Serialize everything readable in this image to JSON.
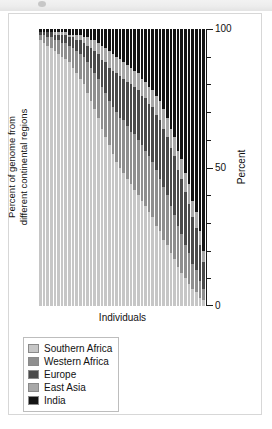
{
  "banner": {
    "label": ""
  },
  "figure": {
    "x_axis_title": "Individuals",
    "y_axis_title_line1": "Percent of genome from",
    "y_axis_title_line2": "different continental regions",
    "right_axis_title": "Percent",
    "axis_ticks": [
      {
        "value": 0,
        "label": "0",
        "major": true
      },
      {
        "value": 10,
        "label": "",
        "major": false
      },
      {
        "value": 20,
        "label": "",
        "major": false
      },
      {
        "value": 30,
        "label": "",
        "major": false
      },
      {
        "value": 40,
        "label": "",
        "major": false
      },
      {
        "value": 50,
        "label": "50",
        "major": true
      },
      {
        "value": 60,
        "label": "",
        "major": false
      },
      {
        "value": 70,
        "label": "",
        "major": false
      },
      {
        "value": 80,
        "label": "",
        "major": false
      },
      {
        "value": 90,
        "label": "",
        "major": false
      },
      {
        "value": 100,
        "label": "100",
        "major": true
      }
    ]
  },
  "legend": {
    "items": [
      {
        "label": "Southern Africa",
        "color": "#c6c6c6"
      },
      {
        "label": "Western Africa",
        "color": "#8f8f8f"
      },
      {
        "label": "Europe",
        "color": "#4a4a4a"
      },
      {
        "label": "East Asia",
        "color": "#a8a8a8"
      },
      {
        "label": "India",
        "color": "#141414"
      }
    ]
  },
  "chart_data": {
    "type": "bar",
    "stacked": true,
    "title": "",
    "xlabel": "Individuals",
    "ylabel": "Percent of genome from different continental regions",
    "right_ylabel": "Percent",
    "ylim": [
      0,
      100
    ],
    "yticks": [
      0,
      10,
      20,
      30,
      40,
      50,
      60,
      70,
      80,
      90,
      100
    ],
    "ytick_labels": [
      "0",
      "",
      "",
      "",
      "",
      "50",
      "",
      "",
      "",
      "",
      "100"
    ],
    "grid": false,
    "legend_position": "below-left",
    "series_order": [
      "Southern Africa",
      "Western Africa",
      "Europe",
      "East Asia",
      "India"
    ],
    "series_colors": {
      "Southern Africa": "#c6c6c6",
      "Western Africa": "#8f8f8f",
      "Europe": "#4a4a4a",
      "East Asia": "#a8a8a8",
      "India": "#141414"
    },
    "note": "Each bar is one individual; segments sum to 100 percent. Bars sorted by increasing non-Southern-African ancestry.",
    "categories": [
      "1",
      "2",
      "3",
      "4",
      "5",
      "6",
      "7",
      "8",
      "9",
      "10",
      "11",
      "12",
      "13",
      "14",
      "15",
      "16",
      "17",
      "18",
      "19",
      "20",
      "21",
      "22",
      "23",
      "24",
      "25",
      "26",
      "27",
      "28",
      "29",
      "30",
      "31",
      "32",
      "33",
      "34",
      "35",
      "36",
      "37",
      "38",
      "39",
      "40",
      "41",
      "42",
      "43",
      "44",
      "45",
      "46"
    ],
    "bars": [
      {
        "individual": "1",
        "Southern Africa": 96,
        "Western Africa": 2,
        "Europe": 1,
        "East Asia": 0,
        "India": 1
      },
      {
        "individual": "2",
        "Southern Africa": 95,
        "Western Africa": 3,
        "Europe": 1,
        "East Asia": 0,
        "India": 1
      },
      {
        "individual": "3",
        "Southern Africa": 94,
        "Western Africa": 3,
        "Europe": 2,
        "East Asia": 0,
        "India": 1
      },
      {
        "individual": "4",
        "Southern Africa": 93,
        "Western Africa": 4,
        "Europe": 2,
        "East Asia": 0,
        "India": 1
      },
      {
        "individual": "5",
        "Southern Africa": 92,
        "Western Africa": 4,
        "Europe": 2,
        "East Asia": 1,
        "India": 1
      },
      {
        "individual": "6",
        "Southern Africa": 91,
        "Western Africa": 5,
        "Europe": 2,
        "East Asia": 1,
        "India": 1
      },
      {
        "individual": "7",
        "Southern Africa": 90,
        "Western Africa": 5,
        "Europe": 3,
        "East Asia": 1,
        "India": 1
      },
      {
        "individual": "8",
        "Southern Africa": 89,
        "Western Africa": 6,
        "Europe": 3,
        "East Asia": 1,
        "India": 1
      },
      {
        "individual": "9",
        "Southern Africa": 88,
        "Western Africa": 6,
        "Europe": 3,
        "East Asia": 1,
        "India": 2
      },
      {
        "individual": "10",
        "Southern Africa": 86,
        "Western Africa": 7,
        "Europe": 4,
        "East Asia": 1,
        "India": 2
      },
      {
        "individual": "11",
        "Southern Africa": 84,
        "Western Africa": 8,
        "Europe": 4,
        "East Asia": 2,
        "India": 2
      },
      {
        "individual": "12",
        "Southern Africa": 82,
        "Western Africa": 9,
        "Europe": 5,
        "East Asia": 2,
        "India": 2
      },
      {
        "individual": "13",
        "Southern Africa": 80,
        "Western Africa": 10,
        "Europe": 5,
        "East Asia": 2,
        "India": 3
      },
      {
        "individual": "14",
        "Southern Africa": 77,
        "Western Africa": 11,
        "Europe": 6,
        "East Asia": 3,
        "India": 3
      },
      {
        "individual": "15",
        "Southern Africa": 74,
        "Western Africa": 12,
        "Europe": 7,
        "East Asia": 3,
        "India": 4
      },
      {
        "individual": "16",
        "Southern Africa": 71,
        "Western Africa": 13,
        "Europe": 8,
        "East Asia": 4,
        "India": 4
      },
      {
        "individual": "17",
        "Southern Africa": 68,
        "Western Africa": 14,
        "Europe": 9,
        "East Asia": 4,
        "India": 5
      },
      {
        "individual": "18",
        "Southern Africa": 64,
        "Western Africa": 15,
        "Europe": 10,
        "East Asia": 5,
        "India": 6
      },
      {
        "individual": "19",
        "Southern Africa": 61,
        "Western Africa": 16,
        "Europe": 11,
        "East Asia": 5,
        "India": 7
      },
      {
        "individual": "20",
        "Southern Africa": 58,
        "Western Africa": 16,
        "Europe": 12,
        "East Asia": 6,
        "India": 8
      },
      {
        "individual": "21",
        "Southern Africa": 55,
        "Western Africa": 17,
        "Europe": 13,
        "East Asia": 6,
        "India": 9
      },
      {
        "individual": "22",
        "Southern Africa": 52,
        "Western Africa": 18,
        "Europe": 14,
        "East Asia": 6,
        "India": 10
      },
      {
        "individual": "23",
        "Southern Africa": 50,
        "Western Africa": 18,
        "Europe": 15,
        "East Asia": 6,
        "India": 11
      },
      {
        "individual": "24",
        "Southern Africa": 48,
        "Western Africa": 19,
        "Europe": 15,
        "East Asia": 6,
        "India": 12
      },
      {
        "individual": "25",
        "Southern Africa": 46,
        "Western Africa": 19,
        "Europe": 16,
        "East Asia": 6,
        "India": 13
      },
      {
        "individual": "26",
        "Southern Africa": 44,
        "Western Africa": 19,
        "Europe": 17,
        "East Asia": 6,
        "India": 14
      },
      {
        "individual": "27",
        "Southern Africa": 42,
        "Western Africa": 20,
        "Europe": 17,
        "East Asia": 6,
        "India": 15
      },
      {
        "individual": "28",
        "Southern Africa": 40,
        "Western Africa": 20,
        "Europe": 18,
        "East Asia": 6,
        "India": 16
      },
      {
        "individual": "29",
        "Southern Africa": 38,
        "Western Africa": 20,
        "Europe": 18,
        "East Asia": 6,
        "India": 18
      },
      {
        "individual": "30",
        "Southern Africa": 36,
        "Western Africa": 20,
        "Europe": 19,
        "East Asia": 6,
        "India": 19
      },
      {
        "individual": "31",
        "Southern Africa": 34,
        "Western Africa": 20,
        "Europe": 19,
        "East Asia": 6,
        "India": 21
      },
      {
        "individual": "32",
        "Southern Africa": 32,
        "Western Africa": 20,
        "Europe": 20,
        "East Asia": 6,
        "India": 22
      },
      {
        "individual": "33",
        "Southern Africa": 29,
        "Western Africa": 20,
        "Europe": 20,
        "East Asia": 7,
        "India": 24
      },
      {
        "individual": "34",
        "Southern Africa": 27,
        "Western Africa": 19,
        "Europe": 21,
        "East Asia": 7,
        "India": 26
      },
      {
        "individual": "35",
        "Southern Africa": 24,
        "Western Africa": 19,
        "Europe": 21,
        "East Asia": 7,
        "India": 29
      },
      {
        "individual": "36",
        "Southern Africa": 22,
        "Western Africa": 18,
        "Europe": 21,
        "East Asia": 7,
        "India": 32
      },
      {
        "individual": "37",
        "Southern Africa": 19,
        "Western Africa": 17,
        "Europe": 21,
        "East Asia": 7,
        "India": 36
      },
      {
        "individual": "38",
        "Southern Africa": 17,
        "Western Africa": 16,
        "Europe": 21,
        "East Asia": 7,
        "India": 39
      },
      {
        "individual": "39",
        "Southern Africa": 14,
        "Western Africa": 15,
        "Europe": 20,
        "East Asia": 7,
        "India": 44
      },
      {
        "individual": "40",
        "Southern Africa": 12,
        "Western Africa": 14,
        "Europe": 20,
        "East Asia": 7,
        "India": 47
      },
      {
        "individual": "41",
        "Southern Africa": 10,
        "Western Africa": 12,
        "Europe": 19,
        "East Asia": 7,
        "India": 52
      },
      {
        "individual": "42",
        "Southern Africa": 8,
        "Western Africa": 11,
        "Europe": 18,
        "East Asia": 7,
        "India": 56
      },
      {
        "individual": "43",
        "Southern Africa": 6,
        "Western Africa": 9,
        "Europe": 17,
        "East Asia": 6,
        "India": 62
      },
      {
        "individual": "44",
        "Southern Africa": 5,
        "Western Africa": 8,
        "Europe": 15,
        "East Asia": 6,
        "India": 66
      },
      {
        "individual": "45",
        "Southern Africa": 3,
        "Western Africa": 6,
        "Europe": 13,
        "East Asia": 5,
        "India": 73
      },
      {
        "individual": "46",
        "Southern Africa": 2,
        "Western Africa": 4,
        "Europe": 10,
        "East Asia": 4,
        "India": 80
      }
    ]
  }
}
